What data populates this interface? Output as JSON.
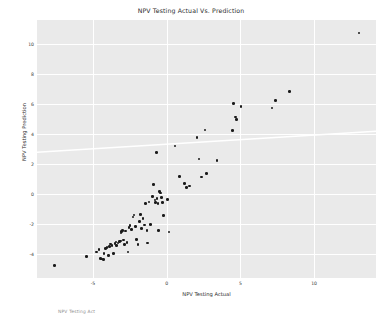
{
  "chart_data": {
    "type": "scatter",
    "title": "NPV Testing Actual Vs. Prediction",
    "xlabel": "NPV Testing Actual",
    "ylabel": "NPV Testing Prediction",
    "xlim": [
      -8.8,
      14.2
    ],
    "ylim": [
      -5.6,
      11.6
    ],
    "xticks": [
      -5,
      0,
      5,
      10
    ],
    "yticks": [
      -4,
      -2,
      0,
      2,
      4,
      6,
      8,
      10
    ],
    "xtick_labels": [
      "-5",
      "0",
      "5",
      "10"
    ],
    "ytick_labels": [
      "-4",
      "-2",
      "0",
      "2",
      "4",
      "6",
      "8",
      "10"
    ],
    "grid": true,
    "grid_color": "#ffffff",
    "plot_background": "#eaeaea",
    "figure_background": "#ffffff",
    "marker_color": "#1a1a1a",
    "legend": null,
    "trend_line": {
      "color": "#ffffff",
      "x_start": -8.8,
      "y_start": 2.78,
      "x_end": 14.2,
      "y_end": 4.18
    },
    "points": [
      {
        "x": -7.6,
        "y": -4.78
      },
      {
        "x": -5.45,
        "y": -4.17
      },
      {
        "x": -4.75,
        "y": -3.86
      },
      {
        "x": -4.6,
        "y": -3.7
      },
      {
        "x": -4.5,
        "y": -4.3
      },
      {
        "x": -4.42,
        "y": -4.33
      },
      {
        "x": -4.3,
        "y": -4.36
      },
      {
        "x": -4.25,
        "y": -3.95
      },
      {
        "x": -4.15,
        "y": -3.62
      },
      {
        "x": -4.05,
        "y": -3.55
      },
      {
        "x": -3.95,
        "y": -4.1
      },
      {
        "x": -3.9,
        "y": -3.5
      },
      {
        "x": -3.8,
        "y": -3.34
      },
      {
        "x": -3.72,
        "y": -3.45
      },
      {
        "x": -3.6,
        "y": -3.95
      },
      {
        "x": -3.5,
        "y": -3.3
      },
      {
        "x": -3.45,
        "y": -3.2
      },
      {
        "x": -3.4,
        "y": -3.42
      },
      {
        "x": -3.3,
        "y": -3.28
      },
      {
        "x": -3.22,
        "y": -3.18
      },
      {
        "x": -3.15,
        "y": -3.12
      },
      {
        "x": -3.1,
        "y": -2.6
      },
      {
        "x": -3.05,
        "y": -2.5
      },
      {
        "x": -3.0,
        "y": -2.42
      },
      {
        "x": -2.95,
        "y": -3.08
      },
      {
        "x": -2.88,
        "y": -3.38
      },
      {
        "x": -2.8,
        "y": -2.48
      },
      {
        "x": -2.7,
        "y": -3.22
      },
      {
        "x": -2.62,
        "y": -3.86
      },
      {
        "x": -2.55,
        "y": -2.22
      },
      {
        "x": -2.48,
        "y": -2.1
      },
      {
        "x": -2.4,
        "y": -2.38
      },
      {
        "x": -2.3,
        "y": -1.52
      },
      {
        "x": -2.22,
        "y": -1.4
      },
      {
        "x": -2.1,
        "y": -2.15
      },
      {
        "x": -2.05,
        "y": -3.05
      },
      {
        "x": -1.95,
        "y": -3.35
      },
      {
        "x": -1.85,
        "y": -1.85
      },
      {
        "x": -1.78,
        "y": -1.38
      },
      {
        "x": -1.7,
        "y": -2.3
      },
      {
        "x": -1.6,
        "y": -1.62
      },
      {
        "x": -1.5,
        "y": -2.08
      },
      {
        "x": -1.42,
        "y": -0.62
      },
      {
        "x": -1.35,
        "y": -2.45
      },
      {
        "x": -1.3,
        "y": -3.28
      },
      {
        "x": -1.2,
        "y": -0.52
      },
      {
        "x": -1.1,
        "y": -2.02
      },
      {
        "x": -0.95,
        "y": -0.18
      },
      {
        "x": -0.88,
        "y": 0.62
      },
      {
        "x": -0.8,
        "y": -0.4
      },
      {
        "x": -0.75,
        "y": -0.55
      },
      {
        "x": -0.7,
        "y": 2.78
      },
      {
        "x": -0.65,
        "y": -0.3
      },
      {
        "x": -0.6,
        "y": -0.62
      },
      {
        "x": -0.55,
        "y": -2.42
      },
      {
        "x": -0.48,
        "y": 0.15
      },
      {
        "x": -0.42,
        "y": 0.08
      },
      {
        "x": -0.35,
        "y": -0.25
      },
      {
        "x": -0.3,
        "y": -0.58
      },
      {
        "x": -0.2,
        "y": -1.45
      },
      {
        "x": 0.05,
        "y": -0.38
      },
      {
        "x": 0.15,
        "y": -2.52
      },
      {
        "x": 0.55,
        "y": 3.2
      },
      {
        "x": 0.85,
        "y": 1.15
      },
      {
        "x": 1.2,
        "y": 0.7
      },
      {
        "x": 1.35,
        "y": 0.45
      },
      {
        "x": 1.55,
        "y": 0.52
      },
      {
        "x": 2.05,
        "y": 3.78
      },
      {
        "x": 2.2,
        "y": 2.32
      },
      {
        "x": 2.35,
        "y": 1.12
      },
      {
        "x": 2.6,
        "y": 4.28
      },
      {
        "x": 2.7,
        "y": 1.38
      },
      {
        "x": 3.4,
        "y": 2.22
      },
      {
        "x": 4.45,
        "y": 4.25
      },
      {
        "x": 4.55,
        "y": 6.05
      },
      {
        "x": 4.65,
        "y": 5.12
      },
      {
        "x": 4.72,
        "y": 4.98
      },
      {
        "x": 5.05,
        "y": 5.82
      },
      {
        "x": 7.15,
        "y": 5.72
      },
      {
        "x": 7.4,
        "y": 6.25
      },
      {
        "x": 8.35,
        "y": 6.85
      },
      {
        "x": 13.05,
        "y": 10.72
      }
    ]
  },
  "footer": {
    "note": "NPV Testing Act"
  }
}
